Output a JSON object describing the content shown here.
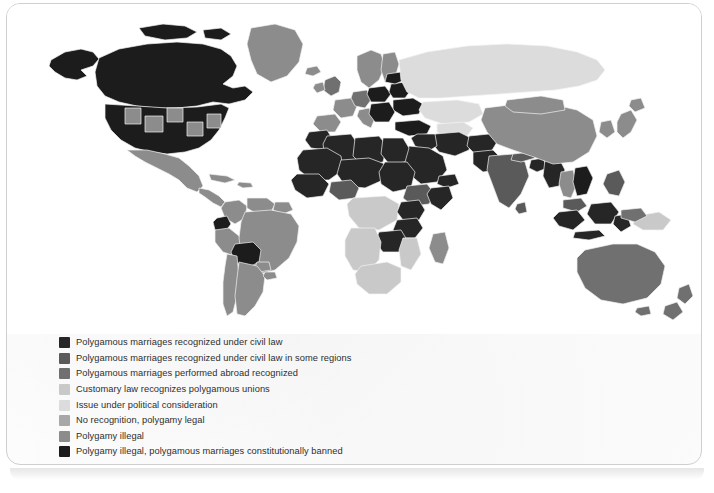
{
  "figure": {
    "type": "choropleth-world-map",
    "palette_note": "grayscale"
  },
  "legend": {
    "items": [
      {
        "label": "Polygamous marriages recognized under civil law",
        "color": "#262626",
        "key": "civil-law"
      },
      {
        "label": "Polygamous marriages recognized under civil law in some regions",
        "color": "#5a5a5a",
        "key": "civil-law-some-regions"
      },
      {
        "label": "Polygamous marriages performed abroad recognized",
        "color": "#707070",
        "key": "abroad-recognized"
      },
      {
        "label": "Customary law recognizes polygamous unions",
        "color": "#c9c9c9",
        "key": "customary-law"
      },
      {
        "label": "Issue under political consideration",
        "color": "#dcdcdc",
        "key": "political-consideration"
      },
      {
        "label": "No recognition, polygamy legal",
        "color": "#a8a8a8",
        "key": "no-recognition-legal"
      },
      {
        "label": "Polygamy illegal",
        "color": "#8c8c8c",
        "key": "illegal"
      },
      {
        "label": "Polygamy illegal, polygamous marriages constitutionally banned",
        "color": "#1c1c1c",
        "key": "illegal-constitutionally-banned"
      }
    ]
  },
  "map": {
    "ocean_color": "#ffffff",
    "border_color": "#f2f2f2",
    "regions": [
      {
        "name": "Canada",
        "category": "illegal-constitutionally-banned",
        "color": "#1c1c1c"
      },
      {
        "name": "Alaska",
        "category": "illegal-constitutionally-banned",
        "color": "#1c1c1c"
      },
      {
        "name": "Greenland",
        "category": "illegal",
        "color": "#8c8c8c"
      },
      {
        "name": "United States",
        "category": "illegal-constitutionally-banned",
        "color": "#1c1c1c"
      },
      {
        "name": "United States (some states)",
        "category": "illegal",
        "color": "#8c8c8c"
      },
      {
        "name": "Mexico",
        "category": "illegal",
        "color": "#8c8c8c"
      },
      {
        "name": "Central America",
        "category": "illegal",
        "color": "#8c8c8c"
      },
      {
        "name": "Caribbean",
        "category": "illegal",
        "color": "#8c8c8c"
      },
      {
        "name": "Colombia",
        "category": "illegal",
        "color": "#8c8c8c"
      },
      {
        "name": "Venezuela",
        "category": "illegal",
        "color": "#8c8c8c"
      },
      {
        "name": "Ecuador",
        "category": "illegal-constitutionally-banned",
        "color": "#1c1c1c"
      },
      {
        "name": "Peru",
        "category": "illegal",
        "color": "#8c8c8c"
      },
      {
        "name": "Bolivia",
        "category": "illegal-constitutionally-banned",
        "color": "#1c1c1c"
      },
      {
        "name": "Brazil",
        "category": "illegal",
        "color": "#8c8c8c"
      },
      {
        "name": "Chile",
        "category": "illegal",
        "color": "#8c8c8c"
      },
      {
        "name": "Argentina",
        "category": "illegal",
        "color": "#8c8c8c"
      },
      {
        "name": "Paraguay",
        "category": "illegal",
        "color": "#8c8c8c"
      },
      {
        "name": "Uruguay",
        "category": "illegal",
        "color": "#8c8c8c"
      },
      {
        "name": "Western Europe",
        "category": "illegal",
        "color": "#8c8c8c"
      },
      {
        "name": "United Kingdom",
        "category": "abroad-recognized",
        "color": "#707070"
      },
      {
        "name": "Scandinavia",
        "category": "illegal",
        "color": "#8c8c8c"
      },
      {
        "name": "Germany",
        "category": "abroad-recognized",
        "color": "#707070"
      },
      {
        "name": "Poland",
        "category": "illegal-constitutionally-banned",
        "color": "#1c1c1c"
      },
      {
        "name": "Belarus",
        "category": "illegal-constitutionally-banned",
        "color": "#1c1c1c"
      },
      {
        "name": "Ukraine",
        "category": "illegal-constitutionally-banned",
        "color": "#1c1c1c"
      },
      {
        "name": "Balkans",
        "category": "illegal-constitutionally-banned",
        "color": "#1c1c1c"
      },
      {
        "name": "Russia",
        "category": "political-consideration",
        "color": "#dcdcdc"
      },
      {
        "name": "Kazakhstan",
        "category": "political-consideration",
        "color": "#dcdcdc"
      },
      {
        "name": "Central Asia",
        "category": "political-consideration",
        "color": "#dcdcdc"
      },
      {
        "name": "Turkey",
        "category": "illegal-constitutionally-banned",
        "color": "#1c1c1c"
      },
      {
        "name": "Morocco",
        "category": "civil-law",
        "color": "#262626"
      },
      {
        "name": "Algeria",
        "category": "civil-law",
        "color": "#262626"
      },
      {
        "name": "Libya",
        "category": "civil-law",
        "color": "#262626"
      },
      {
        "name": "Egypt",
        "category": "civil-law",
        "color": "#262626"
      },
      {
        "name": "Sudan",
        "category": "civil-law",
        "color": "#262626"
      },
      {
        "name": "Sahel",
        "category": "civil-law",
        "color": "#262626"
      },
      {
        "name": "Nigeria",
        "category": "civil-law-some-regions",
        "color": "#5a5a5a"
      },
      {
        "name": "Saudi Arabia",
        "category": "civil-law",
        "color": "#262626"
      },
      {
        "name": "Arabian Peninsula",
        "category": "civil-law",
        "color": "#262626"
      },
      {
        "name": "Iran",
        "category": "civil-law",
        "color": "#262626"
      },
      {
        "name": "Iraq",
        "category": "civil-law",
        "color": "#262626"
      },
      {
        "name": "Ethiopia",
        "category": "civil-law-some-regions",
        "color": "#5a5a5a"
      },
      {
        "name": "Somalia",
        "category": "civil-law",
        "color": "#262626"
      },
      {
        "name": "Kenya",
        "category": "civil-law",
        "color": "#262626"
      },
      {
        "name": "Tanzania",
        "category": "civil-law",
        "color": "#262626"
      },
      {
        "name": "Central Africa",
        "category": "customary-law",
        "color": "#c9c9c9"
      },
      {
        "name": "Southern Africa",
        "category": "customary-law",
        "color": "#c9c9c9"
      },
      {
        "name": "South Africa",
        "category": "customary-law",
        "color": "#c9c9c9"
      },
      {
        "name": "Zimbabwe",
        "category": "civil-law",
        "color": "#262626"
      },
      {
        "name": "Zambia",
        "category": "civil-law",
        "color": "#262626"
      },
      {
        "name": "Madagascar",
        "category": "illegal",
        "color": "#8c8c8c"
      },
      {
        "name": "India",
        "category": "civil-law-some-regions",
        "color": "#5a5a5a"
      },
      {
        "name": "Pakistan",
        "category": "civil-law",
        "color": "#262626"
      },
      {
        "name": "Afghanistan",
        "category": "civil-law",
        "color": "#262626"
      },
      {
        "name": "Bangladesh",
        "category": "civil-law",
        "color": "#262626"
      },
      {
        "name": "Myanmar",
        "category": "civil-law",
        "color": "#262626"
      },
      {
        "name": "Sri Lanka",
        "category": "civil-law-some-regions",
        "color": "#5a5a5a"
      },
      {
        "name": "China",
        "category": "illegal",
        "color": "#8c8c8c"
      },
      {
        "name": "Mongolia",
        "category": "illegal",
        "color": "#8c8c8c"
      },
      {
        "name": "Japan",
        "category": "illegal",
        "color": "#8c8c8c"
      },
      {
        "name": "Korea",
        "category": "illegal",
        "color": "#8c8c8c"
      },
      {
        "name": "Thailand",
        "category": "illegal",
        "color": "#8c8c8c"
      },
      {
        "name": "Vietnam",
        "category": "illegal-constitutionally-banned",
        "color": "#1c1c1c"
      },
      {
        "name": "Malaysia",
        "category": "civil-law-some-regions",
        "color": "#5a5a5a"
      },
      {
        "name": "Indonesia",
        "category": "civil-law",
        "color": "#262626"
      },
      {
        "name": "Philippines",
        "category": "civil-law-some-regions",
        "color": "#5a5a5a"
      },
      {
        "name": "Papua New Guinea",
        "category": "customary-law",
        "color": "#c9c9c9"
      },
      {
        "name": "Australia",
        "category": "abroad-recognized",
        "color": "#707070"
      },
      {
        "name": "New Zealand",
        "category": "abroad-recognized",
        "color": "#707070"
      }
    ]
  }
}
